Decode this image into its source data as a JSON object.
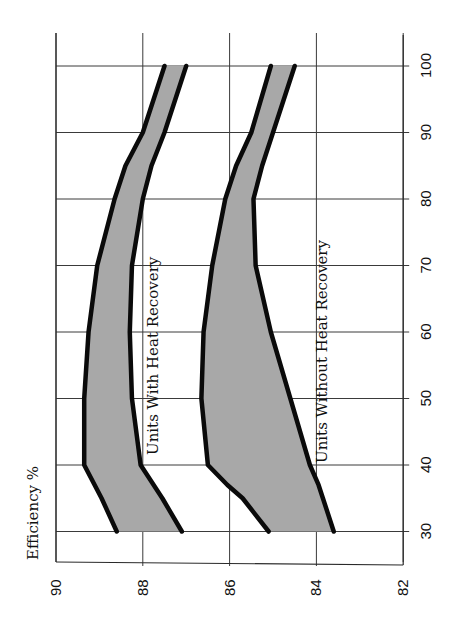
{
  "chart_data": {
    "type": "area",
    "orientation": "rotated 90° counter-clockwise on the page",
    "title": "",
    "ylabel": "Efficiency %",
    "xlabel": "",
    "x_ticks": [
      30,
      40,
      50,
      60,
      70,
      80,
      90,
      100
    ],
    "y_ticks": [
      90,
      88,
      86,
      84,
      82
    ],
    "xlim": [
      30,
      100
    ],
    "ylim": [
      82,
      90
    ],
    "grid": true,
    "fill_color": "#a8a8a8",
    "line_color": "#0a0a0a",
    "series": [
      {
        "name": "Units With Heat Recovery",
        "x": [
          30,
          35,
          40,
          50,
          60,
          70,
          80,
          85,
          90,
          100
        ],
        "upper": [
          88.6,
          88.95,
          89.35,
          89.35,
          89.25,
          89.05,
          88.65,
          88.4,
          88.0,
          87.5
        ],
        "lower": [
          87.1,
          87.55,
          88.05,
          88.25,
          88.3,
          88.25,
          88.0,
          87.8,
          87.5,
          87.0
        ]
      },
      {
        "name": "Units Without Heat Recovery",
        "x": [
          30,
          35,
          37,
          40,
          50,
          60,
          70,
          80,
          85,
          90,
          100
        ],
        "upper": [
          85.1,
          85.7,
          86.05,
          86.5,
          86.65,
          86.6,
          86.4,
          86.1,
          85.85,
          85.5,
          85.05
        ],
        "lower": [
          83.6,
          83.85,
          83.95,
          84.15,
          84.6,
          85.05,
          85.4,
          85.45,
          85.25,
          85.0,
          84.5
        ]
      }
    ],
    "annotations": [
      {
        "text": "Units With Heat Recovery",
        "x_range": [
          46,
          77
        ],
        "y": 87.9
      },
      {
        "text": "Units Without Heat Recovery",
        "x_range": [
          40,
          79
        ],
        "y": 84.0
      }
    ]
  },
  "labels": {
    "efficiency_axis_title": "Efficiency %",
    "band_with_recovery": "Units With Heat Recovery",
    "band_without_recovery": "Units Without Heat Recovery"
  }
}
